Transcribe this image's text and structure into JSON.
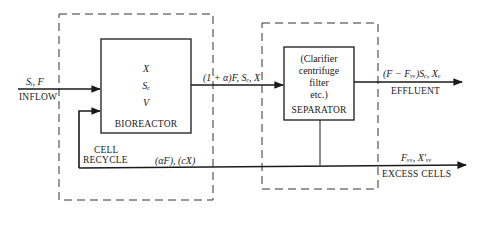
{
  "diagram": {
    "inflow": {
      "vars": "Sᵢ, F",
      "label": "INFLOW"
    },
    "bioreactor": {
      "vars": [
        "X",
        "Sₑ",
        "V"
      ],
      "label": "BIOREACTOR"
    },
    "reactor_outflow": {
      "vars": "(1 + α)F, Sₑ, X"
    },
    "separator": {
      "desc": [
        "(Clarifier",
        "centrifuge",
        "filter",
        "etc.)"
      ],
      "label": "SEPARATOR"
    },
    "effluent": {
      "vars": "(F − Fᵥᵥ)Sₑ, Xₑ",
      "label": "EFFLUENT"
    },
    "recycle": {
      "label_line1": "CELL",
      "label_line2": "RECYCLE",
      "vars": "(αF), (cX)"
    },
    "excess_cells": {
      "vars": "Fᵥᵥ, X′ᵥᵥ",
      "label": "EXCESS CELLS"
    }
  }
}
